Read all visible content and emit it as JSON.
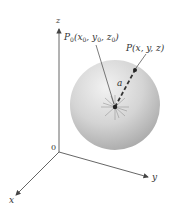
{
  "figure": {
    "axes": {
      "x_label": "x",
      "y_label": "y",
      "z_label": "z",
      "origin_label": "0"
    },
    "points": {
      "center_label_prefix": "P",
      "center_label_sub": "0",
      "center_label_args": "(x",
      "center_x_sub": "0",
      "center_sep1": ", y",
      "center_y_sub": "0",
      "center_sep2": ", z",
      "center_z_sub": "0",
      "center_close": ")",
      "surface_label": "P(x, y, z)"
    },
    "radius_label": "a",
    "colors": {
      "sphere_light": "#efefef",
      "sphere_mid": "#c9c9c9",
      "sphere_dark": "#a9a9a9",
      "axis": "#555555",
      "text": "#333333",
      "radius_line": "#444444"
    }
  }
}
